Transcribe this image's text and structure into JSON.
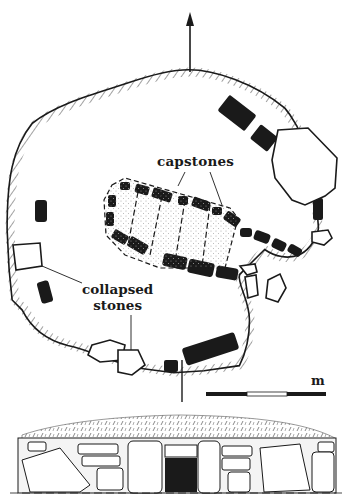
{
  "figure": {
    "type": "archaeological site plan with elevation",
    "north_arrow": {
      "icon": "north-arrow-icon"
    },
    "labels": {
      "capstones": "capstones",
      "collapsed_line1": "collapsed",
      "collapsed_line2": "stones"
    },
    "scale_bar": {
      "unit": "m",
      "segments": [
        "black",
        "white",
        "black"
      ]
    },
    "colors": {
      "ink": "#1a1a1a",
      "paper": "#ffffff",
      "hatch": "#444444",
      "stipple": "#999999"
    },
    "views": [
      "plan",
      "elevation"
    ]
  }
}
